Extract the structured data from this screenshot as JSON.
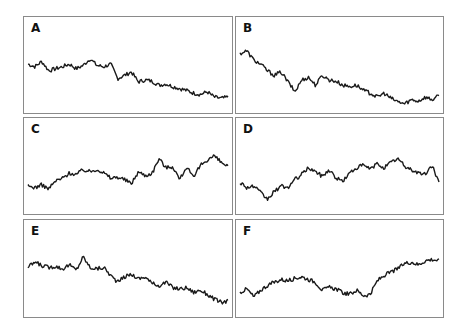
{
  "chart_data": [
    {
      "type": "line",
      "title": "A",
      "panel": "A",
      "trend": "down",
      "values": [
        0.62,
        0.58,
        0.66,
        0.52,
        0.55,
        0.58,
        0.62,
        0.55,
        0.6,
        0.7,
        0.6,
        0.58,
        0.62,
        0.4,
        0.45,
        0.5,
        0.35,
        0.38,
        0.36,
        0.3,
        0.32,
        0.28,
        0.25,
        0.22,
        0.18,
        0.16,
        0.2,
        0.12,
        0.1,
        0.12
      ]
    },
    {
      "type": "line",
      "title": "B",
      "panel": "B",
      "trend": "down",
      "values": [
        0.78,
        0.82,
        0.68,
        0.62,
        0.52,
        0.45,
        0.5,
        0.35,
        0.2,
        0.38,
        0.42,
        0.3,
        0.45,
        0.38,
        0.36,
        0.3,
        0.28,
        0.3,
        0.22,
        0.18,
        0.12,
        0.18,
        0.1,
        0.05,
        0.02,
        0.08,
        0.06,
        0.12,
        0.08,
        0.14
      ]
    },
    {
      "type": "line",
      "title": "C",
      "panel": "C",
      "trend": "up",
      "values": [
        0.3,
        0.28,
        0.32,
        0.26,
        0.38,
        0.42,
        0.5,
        0.48,
        0.55,
        0.52,
        0.56,
        0.5,
        0.42,
        0.44,
        0.4,
        0.34,
        0.52,
        0.46,
        0.5,
        0.72,
        0.58,
        0.6,
        0.4,
        0.6,
        0.42,
        0.62,
        0.7,
        0.76,
        0.66,
        0.6
      ]
    },
    {
      "type": "line",
      "title": "D",
      "panel": "D",
      "trend": "up",
      "values": [
        0.36,
        0.28,
        0.3,
        0.2,
        0.1,
        0.22,
        0.3,
        0.28,
        0.4,
        0.48,
        0.58,
        0.52,
        0.45,
        0.55,
        0.42,
        0.38,
        0.5,
        0.58,
        0.62,
        0.56,
        0.64,
        0.58,
        0.66,
        0.72,
        0.6,
        0.55,
        0.5,
        0.48,
        0.62,
        0.35
      ]
    },
    {
      "type": "line",
      "title": "E",
      "panel": "E",
      "trend": "down",
      "values": [
        0.62,
        0.7,
        0.65,
        0.62,
        0.64,
        0.6,
        0.66,
        0.58,
        0.78,
        0.62,
        0.6,
        0.62,
        0.5,
        0.4,
        0.48,
        0.52,
        0.45,
        0.48,
        0.38,
        0.35,
        0.4,
        0.32,
        0.3,
        0.32,
        0.25,
        0.28,
        0.22,
        0.15,
        0.1,
        0.12
      ]
    },
    {
      "type": "line",
      "title": "F",
      "panel": "F",
      "trend": "up",
      "values": [
        0.25,
        0.3,
        0.18,
        0.28,
        0.35,
        0.4,
        0.44,
        0.42,
        0.46,
        0.48,
        0.44,
        0.4,
        0.28,
        0.32,
        0.3,
        0.24,
        0.22,
        0.28,
        0.2,
        0.22,
        0.42,
        0.5,
        0.55,
        0.6,
        0.68,
        0.7,
        0.66,
        0.72,
        0.74,
        0.72
      ]
    }
  ],
  "panels": [
    {
      "label": "A",
      "x": 23,
      "y": 16,
      "w": 210,
      "h": 98
    },
    {
      "label": "B",
      "x": 235,
      "y": 16,
      "w": 209,
      "h": 98
    },
    {
      "label": "C",
      "x": 23,
      "y": 117,
      "w": 210,
      "h": 98
    },
    {
      "label": "D",
      "x": 235,
      "y": 117,
      "w": 209,
      "h": 98
    },
    {
      "label": "E",
      "x": 23,
      "y": 219,
      "w": 210,
      "h": 99
    },
    {
      "label": "F",
      "x": 235,
      "y": 219,
      "w": 209,
      "h": 99
    }
  ],
  "style": {
    "line_color": "#1a1a1a",
    "border_color": "#8a8a8a"
  }
}
